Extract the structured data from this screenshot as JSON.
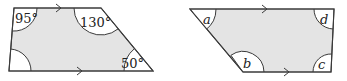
{
  "figures": [
    {
      "name": "known-angles-trapezium",
      "angles": {
        "top_left": "95°",
        "top_right": "130°",
        "bottom_right": "50°",
        "bottom_left": ""
      },
      "parallel_sides": [
        "top",
        "bottom"
      ]
    },
    {
      "name": "variable-angles-trapezium",
      "angles": {
        "top_left": "a",
        "bottom_left": "b",
        "bottom_right": "c",
        "top_right": "d"
      },
      "parallel_sides": [
        "top",
        "bottom"
      ]
    }
  ],
  "colors": {
    "shape_fill": "#e4e4e4",
    "outline": "#3a3a3a",
    "angle_marker": "#ffffff"
  }
}
